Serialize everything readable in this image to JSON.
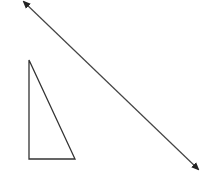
{
  "diagram": {
    "shapes": [
      {
        "type": "right-triangle",
        "label": ""
      },
      {
        "type": "double-headed-line",
        "label": ""
      }
    ],
    "colors": {
      "stroke": "#333333",
      "background": "#ffffff"
    }
  }
}
